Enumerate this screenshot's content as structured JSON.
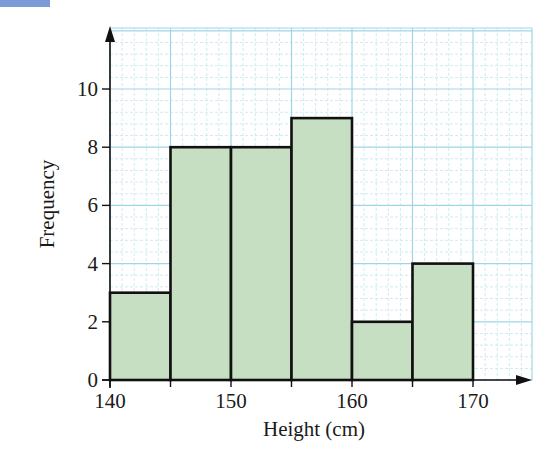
{
  "colors": {
    "corner_tab": "#7b9ad6",
    "bar_fill": "#c6dfc2",
    "bar_stroke": "#111111",
    "grid_major": "#9fd6e6",
    "grid_minor": "#cdebf3",
    "axis": "#111111"
  },
  "layout": {
    "x0_px": 110,
    "px_per_cm": 12.1,
    "x_min": 140,
    "x_max": 175,
    "y0_px": 380,
    "px_per_unit": 29.1,
    "y_min": 0,
    "y_max": 12,
    "grid_top_px": 28,
    "grid_right_px": 532
  },
  "chart_data": {
    "type": "bar",
    "subtype": "histogram",
    "title": "",
    "xlabel": "Height (cm)",
    "ylabel": "Frequency",
    "bins": [
      {
        "from": 140,
        "to": 145,
        "frequency": 3
      },
      {
        "from": 145,
        "to": 150,
        "frequency": 8
      },
      {
        "from": 150,
        "to": 155,
        "frequency": 8
      },
      {
        "from": 155,
        "to": 160,
        "frequency": 9
      },
      {
        "from": 160,
        "to": 165,
        "frequency": 2
      },
      {
        "from": 165,
        "to": 170,
        "frequency": 4
      }
    ],
    "categories": [
      "140-145",
      "145-150",
      "150-155",
      "155-160",
      "160-165",
      "165-170"
    ],
    "values": [
      3,
      8,
      8,
      9,
      2,
      4
    ],
    "x_ticks": [
      140,
      150,
      160,
      170
    ],
    "y_ticks": [
      0,
      2,
      4,
      6,
      8,
      10
    ],
    "xlim": [
      140,
      175
    ],
    "ylim": [
      0,
      12
    ],
    "grid": true,
    "grid_style": "graph paper: solid major lines every 5 cm / 2 units, dashed minor lines every 1 cm / 0.4 units",
    "legend": null
  }
}
